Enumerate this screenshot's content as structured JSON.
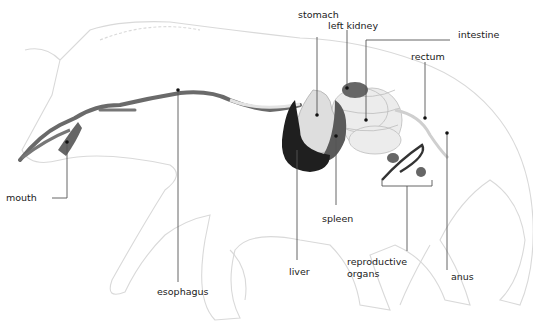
{
  "diagram": {
    "labels": {
      "mouth": "mouth",
      "esophagus": "esophagus",
      "stomach": "stomach",
      "left_kidney": "left kidney",
      "intestine": "intestine",
      "rectum": "rectum",
      "spleen": "spleen",
      "liver": "liver",
      "reproductive_organs_1": "reproductive",
      "reproductive_organs_2": "organs",
      "anus": "anus"
    },
    "colors": {
      "outline": "#d9d9d9",
      "leader": "#555555",
      "liver": "#1f1f1f",
      "organ_dark": "#555555",
      "intestine": "#ececec",
      "tube": "#6a6a6a"
    }
  }
}
